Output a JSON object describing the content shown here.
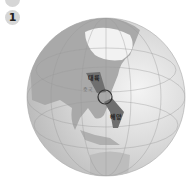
{
  "badges": {
    "top": "",
    "question_number": "1"
  },
  "globe": {
    "labels": {
      "continent": "대륙",
      "ocean": "해양",
      "country": "중국"
    },
    "colors": {
      "sea": "#cfcfcf",
      "land": "#a9a9a9",
      "arrow": "#6f6f6f",
      "circle": "#333333",
      "ice": "#f2f2f2"
    }
  }
}
